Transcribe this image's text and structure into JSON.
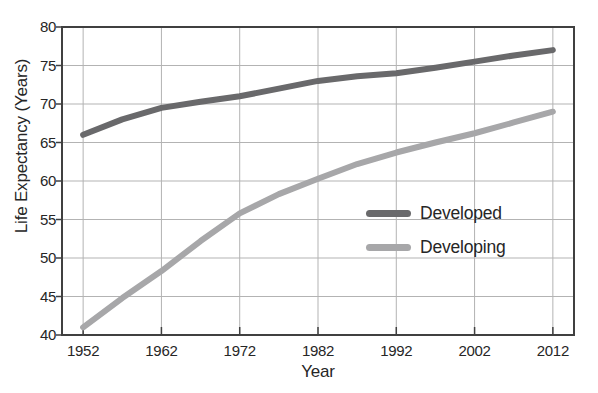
{
  "chart_data": {
    "type": "line",
    "title": "",
    "xlabel": "Year",
    "ylabel": "Life Expectancy (Years)",
    "x": [
      1952,
      1957,
      1962,
      1967,
      1972,
      1977,
      1982,
      1987,
      1992,
      1997,
      2002,
      2007,
      2012
    ],
    "series": [
      {
        "name": "Developed",
        "color": "#69696b",
        "values": [
          66.0,
          68.0,
          69.5,
          70.3,
          71.0,
          72.0,
          73.0,
          73.6,
          74.0,
          74.7,
          75.5,
          76.3,
          77.0
        ]
      },
      {
        "name": "Developing",
        "color": "#a7a7a9",
        "values": [
          41.0,
          44.8,
          48.3,
          52.2,
          55.8,
          58.3,
          60.3,
          62.2,
          63.7,
          65.0,
          66.2,
          67.6,
          69.0
        ]
      }
    ],
    "xticks": [
      1952,
      1962,
      1972,
      1982,
      1992,
      2002,
      2012
    ],
    "yticks": [
      40,
      45,
      50,
      55,
      60,
      65,
      70,
      75,
      80
    ],
    "xlim": [
      1949.3,
      2014.7
    ],
    "ylim": [
      40,
      80
    ],
    "grid": true,
    "legend_position": "center-right",
    "line_width": 6,
    "grid_color": "#b3b3b3",
    "frame_color": "#404040",
    "text_color": "#262626"
  }
}
